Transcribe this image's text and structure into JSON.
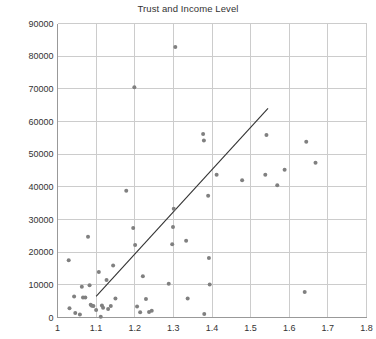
{
  "chart_data": {
    "type": "scatter",
    "title": "Trust and Income Level",
    "xlabel": "",
    "ylabel": "",
    "xlim": [
      1.0,
      1.8
    ],
    "ylim": [
      0,
      90000
    ],
    "grid": true,
    "legend": null,
    "x_ticks": [
      "1",
      "1.1",
      "1.2",
      "1.3",
      "1.4",
      "1.5",
      "1.6",
      "1.7",
      "1.8"
    ],
    "x_tick_values": [
      1.0,
      1.1,
      1.2,
      1.3,
      1.4,
      1.5,
      1.6,
      1.7,
      1.8
    ],
    "y_ticks": [
      "0",
      "10000",
      "20000",
      "30000",
      "40000",
      "50000",
      "60000",
      "70000",
      "80000",
      "90000"
    ],
    "y_tick_values": [
      0,
      10000,
      20000,
      30000,
      40000,
      50000,
      60000,
      70000,
      80000,
      90000
    ],
    "point_color": "#808080",
    "point_size": 4,
    "line_color": "#333333",
    "grid_color": "#cccccc",
    "axis_color": "#999999",
    "background_color": "#ffffff",
    "points": [
      [
        1.029,
        17500
      ],
      [
        1.031,
        2800
      ],
      [
        1.043,
        6400
      ],
      [
        1.046,
        1400
      ],
      [
        1.058,
        900
      ],
      [
        1.063,
        9400
      ],
      [
        1.066,
        6100
      ],
      [
        1.072,
        6100
      ],
      [
        1.079,
        24700
      ],
      [
        1.083,
        9900
      ],
      [
        1.086,
        3900
      ],
      [
        1.089,
        3600
      ],
      [
        1.093,
        3500
      ],
      [
        1.1,
        2300
      ],
      [
        1.107,
        13900
      ],
      [
        1.112,
        200
      ],
      [
        1.115,
        3700
      ],
      [
        1.118,
        3000
      ],
      [
        1.127,
        11500
      ],
      [
        1.131,
        2600
      ],
      [
        1.138,
        3500
      ],
      [
        1.144,
        15900
      ],
      [
        1.15,
        5800
      ],
      [
        1.178,
        38800
      ],
      [
        1.196,
        27400
      ],
      [
        1.199,
        70500
      ],
      [
        1.201,
        22200
      ],
      [
        1.206,
        3400
      ],
      [
        1.214,
        1600
      ],
      [
        1.221,
        12600
      ],
      [
        1.229,
        5700
      ],
      [
        1.237,
        1700
      ],
      [
        1.244,
        2100
      ],
      [
        1.288,
        10300
      ],
      [
        1.297,
        22400
      ],
      [
        1.299,
        27700
      ],
      [
        1.301,
        33300
      ],
      [
        1.305,
        82800
      ],
      [
        1.333,
        23500
      ],
      [
        1.337,
        5800
      ],
      [
        1.377,
        56200
      ],
      [
        1.379,
        54200
      ],
      [
        1.38,
        1100
      ],
      [
        1.39,
        37300
      ],
      [
        1.392,
        18200
      ],
      [
        1.394,
        10100
      ],
      [
        1.412,
        43700
      ],
      [
        1.478,
        42000
      ],
      [
        1.538,
        43700
      ],
      [
        1.541,
        55900
      ],
      [
        1.569,
        40500
      ],
      [
        1.588,
        45200
      ],
      [
        1.64,
        7800
      ],
      [
        1.644,
        53800
      ],
      [
        1.668,
        47400
      ]
    ],
    "trend_line": {
      "x1": 1.1,
      "y1": 6500,
      "x2": 1.545,
      "y2": 64000
    }
  }
}
